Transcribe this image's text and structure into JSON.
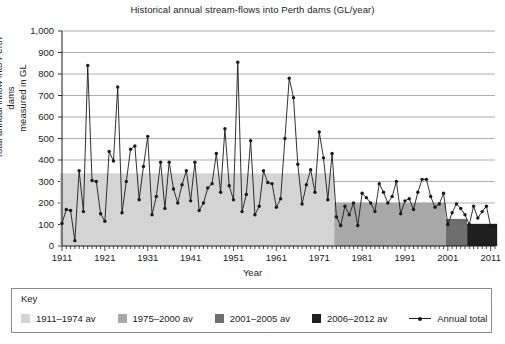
{
  "chart_data": {
    "type": "line",
    "title": "Historical annual stream-flows into Perth dams (GL/year)",
    "xlabel": "Year",
    "ylabel_line1": "Total annual inflow into Perth dams",
    "ylabel_line2": "measured in GL",
    "ylim": [
      0,
      1000
    ],
    "ytick_step": 100,
    "yticks": [
      "0",
      "100",
      "200",
      "300",
      "400",
      "500",
      "600",
      "700",
      "800",
      "900",
      "1,000"
    ],
    "xlim": [
      1911,
      2012
    ],
    "xticks": [
      "1911",
      "1921",
      "1931",
      "1941",
      "1951",
      "1961",
      "1971",
      "1981",
      "1991",
      "2001",
      "2011"
    ],
    "grid": "horizontal",
    "legend_position": "below-plot",
    "series": [
      {
        "name": "Annual total",
        "marker": "dot",
        "color": "#1a1a1a",
        "x": [
          1911,
          1912,
          1913,
          1914,
          1915,
          1916,
          1917,
          1918,
          1919,
          1920,
          1921,
          1922,
          1923,
          1924,
          1925,
          1926,
          1927,
          1928,
          1929,
          1930,
          1931,
          1932,
          1933,
          1934,
          1935,
          1936,
          1937,
          1938,
          1939,
          1940,
          1941,
          1942,
          1943,
          1944,
          1945,
          1946,
          1947,
          1948,
          1949,
          1950,
          1951,
          1952,
          1953,
          1954,
          1955,
          1956,
          1957,
          1958,
          1959,
          1960,
          1961,
          1962,
          1963,
          1964,
          1965,
          1966,
          1967,
          1968,
          1969,
          1970,
          1971,
          1972,
          1973,
          1974,
          1975,
          1976,
          1977,
          1978,
          1979,
          1980,
          1981,
          1982,
          1983,
          1984,
          1985,
          1986,
          1987,
          1988,
          1989,
          1990,
          1991,
          1992,
          1993,
          1994,
          1995,
          1996,
          1997,
          1998,
          1999,
          2000,
          2001,
          2002,
          2003,
          2004,
          2005,
          2006,
          2007,
          2008,
          2009,
          2010,
          2011,
          2012
        ],
        "values": [
          105,
          170,
          165,
          25,
          350,
          160,
          840,
          305,
          300,
          150,
          115,
          440,
          395,
          740,
          155,
          300,
          450,
          465,
          215,
          370,
          510,
          145,
          230,
          390,
          175,
          390,
          265,
          200,
          285,
          350,
          210,
          390,
          165,
          200,
          270,
          290,
          430,
          250,
          545,
          280,
          215,
          855,
          160,
          240,
          490,
          145,
          185,
          350,
          295,
          290,
          180,
          220,
          500,
          780,
          690,
          380,
          195,
          285,
          355,
          250,
          530,
          410,
          215,
          430,
          135,
          95,
          185,
          145,
          200,
          95,
          245,
          225,
          200,
          160,
          290,
          250,
          200,
          230,
          300,
          150,
          210,
          220,
          170,
          250,
          310,
          310,
          230,
          180,
          195,
          245,
          100,
          155,
          195,
          175,
          145,
          100,
          185,
          130,
          160,
          185,
          90,
          95
        ]
      }
    ],
    "bands": [
      {
        "name": "1911-1974 av",
        "label": "1911–1974 av",
        "start": 1911,
        "end": 1974,
        "value": 338,
        "color": "#d4d4d4"
      },
      {
        "name": "1975-2000 av",
        "label": "1975–2000 av",
        "start": 1975,
        "end": 2000,
        "value": 201,
        "color": "#a8a8a8"
      },
      {
        "name": "2001-2005 av",
        "label": "2001–2005 av",
        "start": 2001,
        "end": 2005,
        "value": 126,
        "color": "#6e6e6e"
      },
      {
        "name": "2006-2012 av",
        "label": "2006–2012 av",
        "start": 2006,
        "end": 2012,
        "value": 103,
        "color": "#1f1f1f"
      }
    ],
    "legend": {
      "title": "Key",
      "line_entry_label": "Annual total"
    }
  }
}
